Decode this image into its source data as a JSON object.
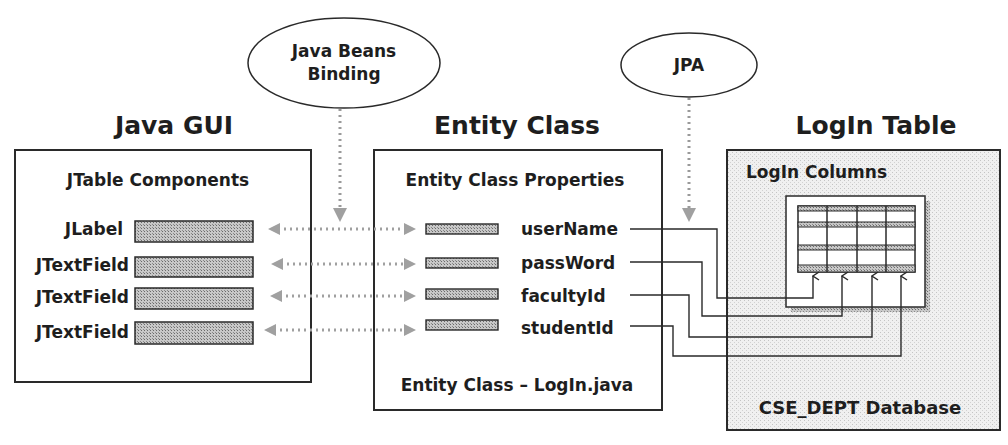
{
  "ellipses": {
    "binding": {
      "line1": "Java Beans",
      "line2": "Binding"
    },
    "jpa": {
      "label": "JPA"
    }
  },
  "headings": {
    "gui": "Java GUI",
    "entity": "Entity Class",
    "table": "LogIn Table"
  },
  "gui_box": {
    "title": "JTable Components",
    "components": [
      {
        "label": "JLabel"
      },
      {
        "label": "JTextField"
      },
      {
        "label": "JTextField"
      },
      {
        "label": "JTextField"
      }
    ]
  },
  "entity_box": {
    "title": "Entity Class Properties",
    "properties": [
      {
        "name": "userName"
      },
      {
        "name": "passWord"
      },
      {
        "name": "facultyId"
      },
      {
        "name": "studentId"
      }
    ],
    "footer": "Entity Class – LogIn.java"
  },
  "table_box": {
    "title": "LogIn Columns",
    "footer": "CSE_DEPT Database",
    "columns": 4
  },
  "colors": {
    "stroke": "#2a2a2a",
    "field_fill": "#a8a8a8",
    "db_fill": "#ececec",
    "arrow_dots": "#9a9a9a"
  }
}
